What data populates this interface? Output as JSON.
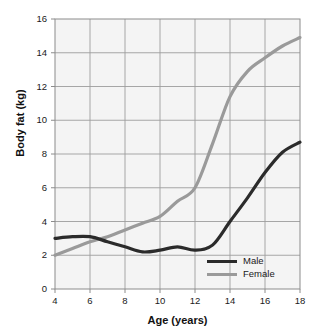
{
  "chart_data": {
    "type": "line",
    "title": "",
    "xlabel": "Age (years)",
    "ylabel": "Body fat (kg)",
    "xlim": [
      4,
      18
    ],
    "ylim": [
      0,
      16
    ],
    "xticks": [
      4,
      6,
      8,
      10,
      12,
      14,
      16,
      18
    ],
    "yticks": [
      0,
      2,
      4,
      6,
      8,
      10,
      12,
      14,
      16
    ],
    "grid": true,
    "legend_position": "lower-right-inside",
    "x": [
      4,
      5,
      6,
      7,
      8,
      9,
      10,
      11,
      12,
      13,
      14,
      15,
      16,
      17,
      18
    ],
    "series": [
      {
        "name": "Male",
        "color": "#2b2b2b",
        "values": [
          3.0,
          3.1,
          3.1,
          2.8,
          2.5,
          2.2,
          2.3,
          2.5,
          2.3,
          2.6,
          4.0,
          5.4,
          6.9,
          8.1,
          8.7
        ]
      },
      {
        "name": "Female",
        "color": "#9a9a9a",
        "values": [
          2.0,
          2.4,
          2.8,
          3.1,
          3.5,
          3.9,
          4.3,
          5.2,
          6.0,
          8.6,
          11.4,
          12.9,
          13.7,
          14.4,
          14.9
        ]
      }
    ]
  },
  "axes": {
    "y_tick_labels": [
      "16",
      "14",
      "12",
      "10",
      "8",
      "6",
      "4",
      "2",
      "0"
    ],
    "x_tick_labels": [
      "4",
      "6",
      "8",
      "10",
      "12",
      "14",
      "16",
      "18"
    ],
    "y_axis_title": "Body fat (kg)",
    "x_axis_title": "Age (years)"
  },
  "legend": {
    "items": [
      {
        "label": "Male",
        "color": "#2b2b2b"
      },
      {
        "label": "Female",
        "color": "#9a9a9a"
      }
    ]
  },
  "style": {
    "plot_background": "#f4f4f4",
    "grid_color": "#9d9d9d",
    "border_color": "#8c8c8c",
    "page_background": "#ffffff",
    "text_color": "#1a1a1a"
  }
}
